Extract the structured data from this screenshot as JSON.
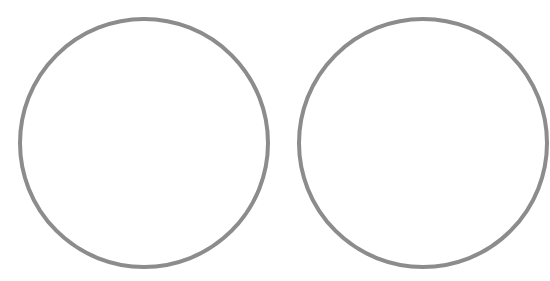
{
  "canvas": {
    "width": 550,
    "height": 281,
    "background": "#ffffff"
  },
  "shapes": [
    {
      "type": "circle",
      "cx": 144,
      "cy": 143,
      "r": 124,
      "stroke": "#8c8c8c",
      "stroke_width": 4,
      "fill": "none"
    },
    {
      "type": "circle",
      "cx": 423,
      "cy": 143,
      "r": 124,
      "stroke": "#8c8c8c",
      "stroke_width": 4,
      "fill": "none"
    }
  ]
}
